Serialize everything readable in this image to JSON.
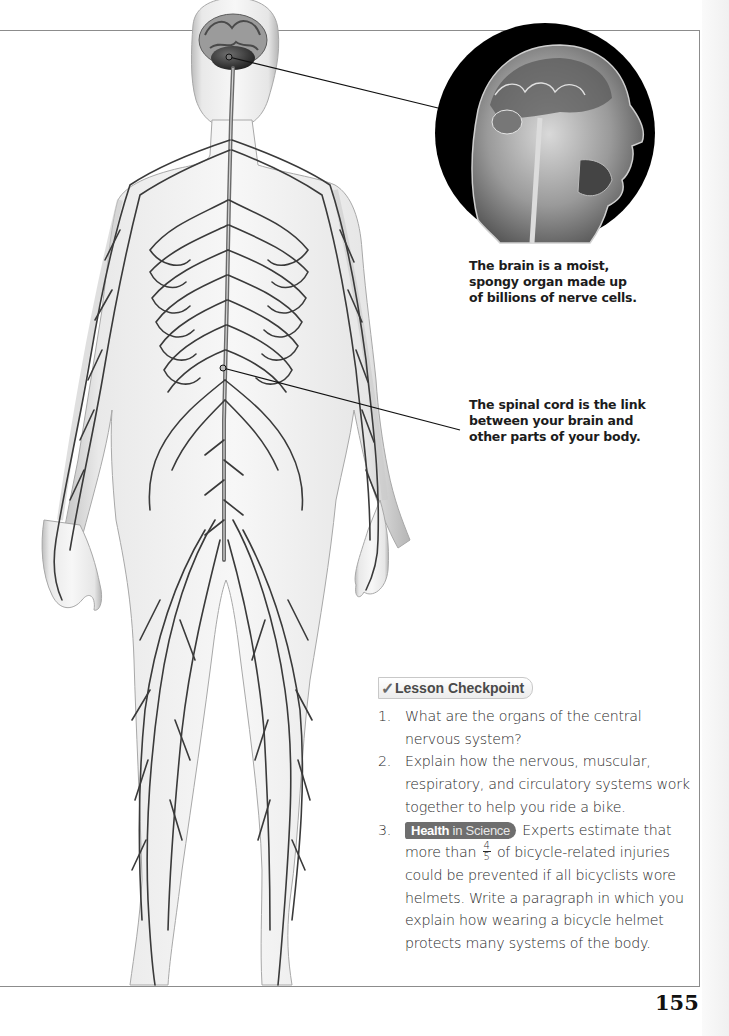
{
  "page": {
    "number": "155"
  },
  "figure": {
    "callouts": [
      {
        "id": "brain",
        "text": "The brain is a moist, spongy organ made up of billions of nerve cells.",
        "lines": [
          "The brain is a moist,",
          "spongy organ made up",
          "of billions of nerve cells."
        ]
      },
      {
        "id": "spinal_cord",
        "text": "The spinal cord is the link between your brain and other parts of your body.",
        "lines": [
          "The spinal cord is the link",
          "between your brain and",
          "other parts of your body."
        ]
      }
    ]
  },
  "checkpoint": {
    "icon": "check-mark-icon",
    "title": "Lesson Checkpoint",
    "items": [
      {
        "number": "1.",
        "text": "What are the organs of the central nervous system?"
      },
      {
        "number": "2.",
        "text": "Explain how the nervous, muscular, respiratory, and circulatory systems work together to help you ride a bike."
      },
      {
        "number": "3.",
        "badge_bold": "Health",
        "badge_rest": "in Science",
        "text_before": "Experts estimate that more than",
        "fraction_num": "4",
        "fraction_den": "5",
        "text_after": "of bicycle-related injuries could be prevented if all bicyclists wore helmets. Write a paragraph in which you explain how wearing a bicycle helmet protects many systems of the body."
      }
    ]
  },
  "colors": {
    "border": "#8c8c8c",
    "badge_dark": "#6e6e6e",
    "text": "#231f20",
    "nerve": "#3a3a3a"
  }
}
